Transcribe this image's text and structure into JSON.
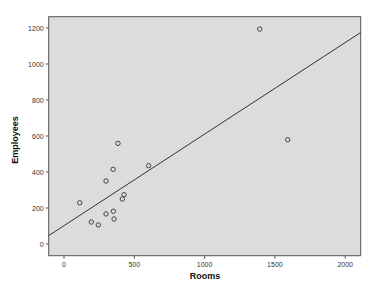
{
  "chart_data": {
    "type": "scatter",
    "title": "",
    "xlabel": "Rooms",
    "ylabel": "Employees",
    "xlim": [
      -110,
      2110
    ],
    "ylim": [
      -65,
      1265
    ],
    "x_ticks": [
      0,
      500,
      1000,
      1500,
      2000
    ],
    "y_ticks": [
      0,
      200,
      400,
      600,
      800,
      1000,
      1200
    ],
    "x_tick_labels": [
      "0",
      "500",
      "1000",
      "1500",
      "2000"
    ],
    "y_tick_labels": [
      "0",
      "200",
      "400",
      "600",
      "800",
      "1000",
      "1200"
    ],
    "grid": false,
    "legend": null,
    "series": [
      {
        "name": "Employees vs Rooms",
        "marker": "open-circle",
        "points": [
          {
            "x": 112,
            "y": 229
          },
          {
            "x": 194,
            "y": 122
          },
          {
            "x": 244,
            "y": 106
          },
          {
            "x": 299,
            "y": 167
          },
          {
            "x": 299,
            "y": 350
          },
          {
            "x": 349,
            "y": 415
          },
          {
            "x": 351,
            "y": 182
          },
          {
            "x": 356,
            "y": 139
          },
          {
            "x": 384,
            "y": 559
          },
          {
            "x": 415,
            "y": 250
          },
          {
            "x": 427,
            "y": 274
          },
          {
            "x": 602,
            "y": 435
          },
          {
            "x": 1392,
            "y": 1194
          },
          {
            "x": 1591,
            "y": 579
          }
        ]
      }
    ],
    "fit_line": {
      "type": "linear",
      "start": {
        "x": -110,
        "y": 46
      },
      "end": {
        "x": 2110,
        "y": 1175
      }
    },
    "colors": {
      "plot_background": "#dcdcdc",
      "frame": "#555555",
      "marker": "#444444",
      "fit_line": "#333333"
    }
  }
}
